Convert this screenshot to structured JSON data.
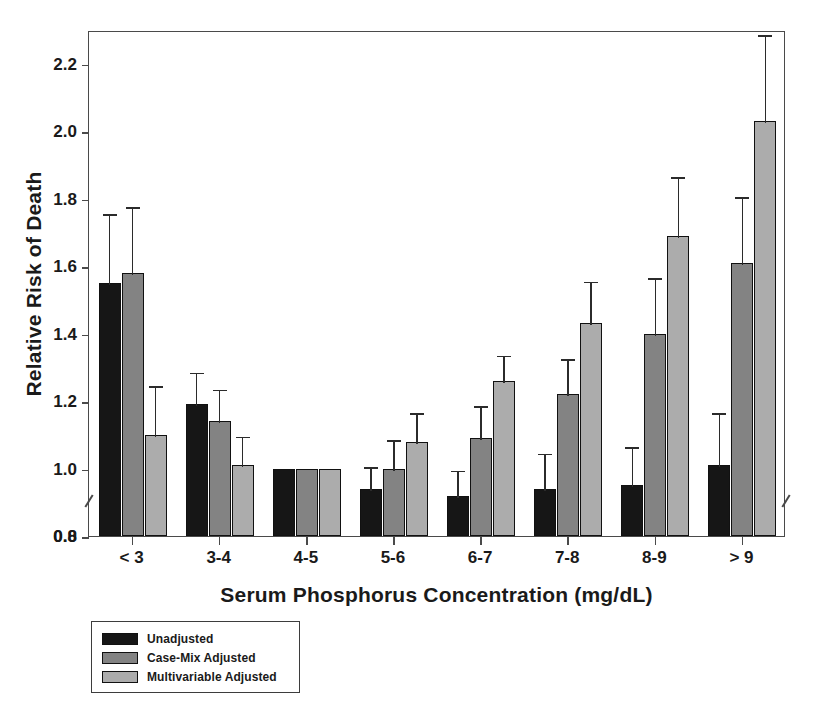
{
  "chart_data": {
    "type": "bar",
    "title": "",
    "xlabel": "Serum Phosphorus Concentration (mg/dL)",
    "ylabel": "Relative Risk of Death",
    "categories": [
      "< 3",
      "3-4",
      "4-5",
      "5-6",
      "6-7",
      "7-8",
      "8-9",
      "> 9"
    ],
    "ylim": [
      0.8,
      2.3
    ],
    "ytick_labels": [
      "2.2",
      "2.0",
      "1.8",
      "1.6",
      "1.4",
      "1.2",
      "1.0",
      "0.8",
      "0.0"
    ],
    "ytick_values": [
      2.2,
      2.0,
      1.8,
      1.6,
      1.4,
      1.2,
      1.0,
      0.8,
      0.0
    ],
    "axis_break": true,
    "axis_break_between": [
      0.0,
      0.8
    ],
    "grid": false,
    "legend_position": "below-left",
    "series": [
      {
        "name": "Unadjusted",
        "color": "#161616",
        "values": [
          1.55,
          1.19,
          1.0,
          0.94,
          0.92,
          0.94,
          0.95,
          1.01
        ],
        "ci_low": [
          1.36,
          1.1,
          1.0,
          0.87,
          0.85,
          0.85,
          0.85,
          0.86
        ],
        "ci_high": [
          1.76,
          1.29,
          1.0,
          1.01,
          1.0,
          1.05,
          1.07,
          1.17
        ]
      },
      {
        "name": "Case-Mix Adjusted",
        "color": "#838383",
        "values": [
          1.58,
          1.14,
          1.0,
          1.0,
          1.09,
          1.22,
          1.4,
          1.61
        ],
        "ci_low": [
          1.4,
          1.05,
          1.0,
          0.92,
          1.0,
          1.11,
          1.25,
          1.42
        ],
        "ci_high": [
          1.78,
          1.24,
          1.0,
          1.09,
          1.19,
          1.33,
          1.57,
          1.81
        ]
      },
      {
        "name": "Multivariable Adjusted",
        "color": "#acacac",
        "values": [
          1.1,
          1.01,
          1.0,
          1.08,
          1.26,
          1.43,
          1.69,
          2.03
        ],
        "ci_low": [
          0.97,
          0.93,
          1.0,
          0.99,
          1.17,
          1.31,
          1.52,
          1.8
        ],
        "ci_high": [
          1.25,
          1.1,
          1.0,
          1.17,
          1.34,
          1.56,
          1.87,
          2.29
        ]
      }
    ]
  },
  "axes": {
    "y_title": "Relative Risk of Death",
    "x_title": "Serum Phosphorus Concentration (mg/dL)"
  },
  "legend": {
    "items": [
      {
        "label": "Unadjusted",
        "swatch": "s0"
      },
      {
        "label": "Case-Mix Adjusted",
        "swatch": "s1"
      },
      {
        "label": "Multivariable Adjusted",
        "swatch": "s2"
      }
    ]
  }
}
